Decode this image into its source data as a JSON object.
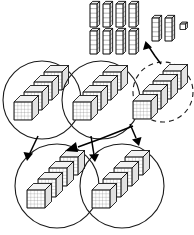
{
  "diagram": {
    "background_color": "#ffffff",
    "ink_color": "#1a1a1a",
    "groups": [
      {
        "id": "group-top-left",
        "label": "Group 1",
        "style": "solid",
        "cx": 42,
        "cy": 100,
        "r": 39,
        "block_count": 4
      },
      {
        "id": "group-top-middle",
        "label": "Group 2",
        "style": "solid",
        "cx": 101,
        "cy": 100,
        "r": 39,
        "block_count": 4
      },
      {
        "id": "group-top-right-dashed",
        "label": "Group 3",
        "style": "dashed",
        "cx": 163,
        "cy": 92,
        "r": 30,
        "block_count": 4
      },
      {
        "id": "group-bottom-left",
        "label": "Group 4",
        "style": "solid",
        "cx": 57,
        "cy": 186,
        "r": 42,
        "block_count": 4
      },
      {
        "id": "group-bottom-right",
        "label": "Group 5",
        "style": "solid",
        "cx": 122,
        "cy": 186,
        "r": 42,
        "block_count": 4
      }
    ],
    "rods": {
      "label": "Ten-rods",
      "segments_per_rod": 5,
      "left_cluster": {
        "rows": 2,
        "columns": 4,
        "count": 8
      },
      "right_cluster": {
        "rows": 1,
        "columns": 2,
        "count": 2
      },
      "unit_cube": {
        "label": "Unit cube",
        "count": 1
      }
    },
    "arrows": [
      {
        "id": "arrow-dashed-to-rods",
        "from": "group-top-right-dashed",
        "to": "rods-left-cluster"
      },
      {
        "id": "arrow-topleft-to-bottomleft",
        "from": "group-top-left",
        "to": "group-bottom-left"
      },
      {
        "id": "arrow-topmiddle-to-bottomright",
        "from": "group-top-middle",
        "to": "group-bottom-right"
      },
      {
        "id": "arrow-dashed-to-bottomleft",
        "from": "group-top-right-dashed",
        "to": "group-bottom-left"
      },
      {
        "id": "arrow-dashed-to-bottomright",
        "from": "group-top-right-dashed",
        "to": "group-bottom-right"
      }
    ]
  }
}
